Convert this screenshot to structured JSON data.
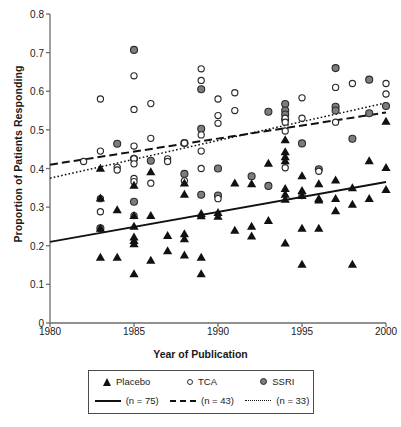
{
  "chart_data": {
    "type": "scatter",
    "title": "",
    "xlabel": "Year of Publication",
    "ylabel": "Proportion of Patients Responding",
    "xlim": [
      1980,
      2000
    ],
    "ylim": [
      0,
      0.8
    ],
    "xticks": [
      "1980",
      "1985",
      "1990",
      "1995",
      "2000"
    ],
    "xtick_values": [
      1980,
      1985,
      1990,
      1995,
      2000
    ],
    "yticks": [
      "0",
      "0.1",
      "0.2",
      "0.3",
      "0.4",
      "0.5",
      "0.6",
      "0.7",
      "0.8"
    ],
    "ytick_values": [
      0,
      0.1,
      0.2,
      0.3,
      0.4,
      0.5,
      0.6,
      0.7,
      0.8
    ],
    "grid": false,
    "legend_position": "below",
    "series": [
      {
        "name": "Placebo",
        "n": 75,
        "marker": "filled-triangle",
        "color": "#111111",
        "line_style": "solid",
        "trend": {
          "x0": 1980,
          "y0": 0.21,
          "x1": 2000,
          "y1": 0.365
        },
        "points": [
          [
            1983,
            0.323
          ],
          [
            1983,
            0.4
          ],
          [
            1983,
            0.245
          ],
          [
            1983,
            0.17
          ],
          [
            1984,
            0.293
          ],
          [
            1984,
            0.17
          ],
          [
            1985,
            0.278
          ],
          [
            1985,
            0.356
          ],
          [
            1985,
            0.25
          ],
          [
            1985,
            0.222
          ],
          [
            1985,
            0.213
          ],
          [
            1985,
            0.205
          ],
          [
            1985,
            0.127
          ],
          [
            1986,
            0.391
          ],
          [
            1986,
            0.278
          ],
          [
            1986,
            0.162
          ],
          [
            1987,
            0.226
          ],
          [
            1987,
            0.187
          ],
          [
            1988,
            0.362
          ],
          [
            1988,
            0.333
          ],
          [
            1988,
            0.231
          ],
          [
            1988,
            0.218
          ],
          [
            1988,
            0.176
          ],
          [
            1989,
            0.283
          ],
          [
            1989,
            0.277
          ],
          [
            1989,
            0.17
          ],
          [
            1989,
            0.127
          ],
          [
            1990,
            0.286
          ],
          [
            1990,
            0.276
          ],
          [
            1991,
            0.362
          ],
          [
            1991,
            0.24
          ],
          [
            1992,
            0.36
          ],
          [
            1992,
            0.25
          ],
          [
            1992,
            0.225
          ],
          [
            1993,
            0.413
          ],
          [
            1993,
            0.265
          ],
          [
            1994,
            0.474
          ],
          [
            1994,
            0.443
          ],
          [
            1994,
            0.43
          ],
          [
            1994,
            0.42
          ],
          [
            1994,
            0.348
          ],
          [
            1994,
            0.333
          ],
          [
            1994,
            0.32
          ],
          [
            1994,
            0.207
          ],
          [
            1995,
            0.381
          ],
          [
            1995,
            0.343
          ],
          [
            1995,
            0.33
          ],
          [
            1995,
            0.245
          ],
          [
            1995,
            0.152
          ],
          [
            1996,
            0.36
          ],
          [
            1996,
            0.322
          ],
          [
            1996,
            0.318
          ],
          [
            1996,
            0.245
          ],
          [
            1997,
            0.37
          ],
          [
            1997,
            0.322
          ],
          [
            1997,
            0.29
          ],
          [
            1998,
            0.35
          ],
          [
            1998,
            0.307
          ],
          [
            1998,
            0.152
          ],
          [
            1999,
            0.42
          ],
          [
            1999,
            0.322
          ],
          [
            2000,
            0.522
          ],
          [
            2000,
            0.402
          ],
          [
            2000,
            0.345
          ]
        ]
      },
      {
        "name": "TCA",
        "n": 43,
        "marker": "open-circle",
        "color": "#ffffff",
        "line_style": "dashed",
        "trend": {
          "x0": 1980,
          "y0": 0.41,
          "x1": 2000,
          "y1": 0.545
        },
        "points": [
          [
            1982,
            0.418
          ],
          [
            1983,
            0.58
          ],
          [
            1983,
            0.445
          ],
          [
            1983,
            0.322
          ],
          [
            1983,
            0.288
          ],
          [
            1984,
            0.403
          ],
          [
            1984,
            0.396
          ],
          [
            1985,
            0.64
          ],
          [
            1985,
            0.553
          ],
          [
            1985,
            0.458
          ],
          [
            1985,
            0.425
          ],
          [
            1985,
            0.412
          ],
          [
            1985,
            0.374
          ],
          [
            1985,
            0.366
          ],
          [
            1985,
            0.278
          ],
          [
            1986,
            0.568
          ],
          [
            1986,
            0.478
          ],
          [
            1986,
            0.362
          ],
          [
            1987,
            0.425
          ],
          [
            1987,
            0.418
          ],
          [
            1988,
            0.466
          ],
          [
            1988,
            0.368
          ],
          [
            1989,
            0.658
          ],
          [
            1989,
            0.628
          ],
          [
            1989,
            0.487
          ],
          [
            1989,
            0.445
          ],
          [
            1989,
            0.4
          ],
          [
            1990,
            0.58
          ],
          [
            1990,
            0.537
          ],
          [
            1990,
            0.517
          ],
          [
            1990,
            0.322
          ],
          [
            1991,
            0.596
          ],
          [
            1991,
            0.55
          ],
          [
            1994,
            0.53
          ],
          [
            1994,
            0.52
          ],
          [
            1994,
            0.497
          ],
          [
            1994,
            0.402
          ],
          [
            1995,
            0.583
          ],
          [
            1995,
            0.53
          ],
          [
            1995,
            0.33
          ],
          [
            1996,
            0.393
          ],
          [
            1997,
            0.61
          ],
          [
            1997,
            0.52
          ],
          [
            1998,
            0.62
          ],
          [
            2000,
            0.62
          ],
          [
            2000,
            0.593
          ]
        ]
      },
      {
        "name": "SSRI",
        "n": 33,
        "marker": "gray-circle",
        "color": "#7d7d7d",
        "line_style": "dotted",
        "trend": {
          "x0": 1980,
          "y0": 0.375,
          "x1": 2000,
          "y1": 0.57
        },
        "points": [
          [
            1983,
            0.245
          ],
          [
            1984,
            0.464
          ],
          [
            1985,
            0.707
          ],
          [
            1985,
            0.425
          ],
          [
            1985,
            0.314
          ],
          [
            1986,
            0.42
          ],
          [
            1988,
            0.466
          ],
          [
            1988,
            0.386
          ],
          [
            1989,
            0.605
          ],
          [
            1989,
            0.503
          ],
          [
            1989,
            0.332
          ],
          [
            1990,
            0.4
          ],
          [
            1990,
            0.33
          ],
          [
            1992,
            0.38
          ],
          [
            1993,
            0.547
          ],
          [
            1993,
            0.355
          ],
          [
            1994,
            0.567
          ],
          [
            1994,
            0.55
          ],
          [
            1994,
            0.54
          ],
          [
            1994,
            0.527
          ],
          [
            1995,
            0.465
          ],
          [
            1996,
            0.398
          ],
          [
            1997,
            0.66
          ],
          [
            1997,
            0.56
          ],
          [
            1997,
            0.55
          ],
          [
            1998,
            0.477
          ],
          [
            1999,
            0.63
          ],
          [
            1999,
            0.543
          ],
          [
            2000,
            0.562
          ]
        ]
      }
    ]
  },
  "legend": {
    "entries": [
      {
        "label": "Placebo",
        "n_label": "(n = 75)",
        "marker": "filled-triangle",
        "line": "solid"
      },
      {
        "label": "TCA",
        "n_label": "(n = 43)",
        "marker": "open-circle",
        "line": "dashed"
      },
      {
        "label": "SSRI",
        "n_label": "(n = 33)",
        "marker": "gray-circle",
        "line": "dotted"
      }
    ]
  },
  "colors": {
    "placebo": "#111111",
    "tca_fill": "#ffffff",
    "ssri_fill": "#7d7d7d",
    "axis": "#6e6e6e",
    "text": "#1a1a1a",
    "background": "#ffffff"
  }
}
